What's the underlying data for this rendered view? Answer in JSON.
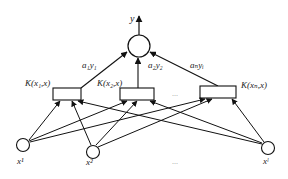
{
  "diagram": {
    "type": "kernel network (SVM-style)",
    "output": {
      "label": "y",
      "x": 139,
      "y": 46,
      "r": 11
    },
    "weights": [
      {
        "label": "a₁y₁",
        "x": 82,
        "y": 68
      },
      {
        "label": "a₂y₂",
        "x": 148,
        "y": 68
      },
      {
        "label": "aₙyᵢ",
        "x": 190,
        "y": 68
      }
    ],
    "kernels": [
      {
        "label": "K(x₁,x)",
        "box": [
          53,
          88,
          28,
          12
        ],
        "label_pos": [
          25,
          88
        ]
      },
      {
        "label": "K(x₂,x)",
        "box": [
          120,
          88,
          34,
          12
        ],
        "label_pos": [
          96,
          88
        ]
      },
      {
        "label": "K(xₙ,x)",
        "box": [
          200,
          86,
          36,
          12
        ],
        "label_pos": [
          241,
          88
        ]
      }
    ],
    "kernel_ellipsis": "...",
    "inputs": [
      {
        "label": "x¹",
        "x": 23,
        "y": 145
      },
      {
        "label": "x²",
        "x": 93,
        "y": 152
      },
      {
        "label": "xˡ",
        "x": 268,
        "y": 148
      }
    ],
    "input_ellipsis": "..."
  }
}
